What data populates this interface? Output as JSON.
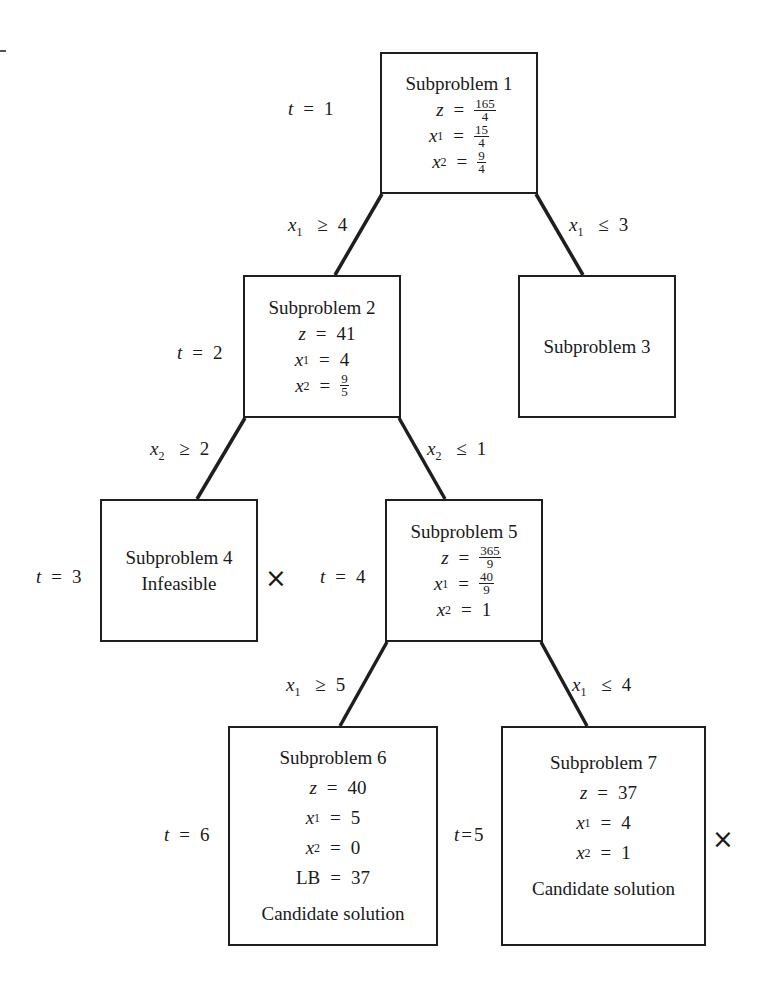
{
  "diagram": {
    "type": "branch-and-bound-tree",
    "iteration_prefix": "t",
    "nodes": [
      {
        "id": 1,
        "title": "Subproblem 1",
        "iteration": "1",
        "z": {
          "num": "165",
          "den": "4"
        },
        "x1": {
          "num": "15",
          "den": "4"
        },
        "x2": {
          "num": "9",
          "den": "4"
        }
      },
      {
        "id": 2,
        "title": "Subproblem 2",
        "iteration": "2",
        "z": "41",
        "x1": "4",
        "x2": {
          "num": "9",
          "den": "5"
        }
      },
      {
        "id": 3,
        "title": "Subproblem 3"
      },
      {
        "id": 4,
        "title": "Subproblem 4",
        "iteration": "3",
        "status": "Infeasible",
        "fathomed": true
      },
      {
        "id": 5,
        "title": "Subproblem 5",
        "iteration": "4",
        "z": {
          "num": "365",
          "den": "9"
        },
        "x1": {
          "num": "40",
          "den": "9"
        },
        "x2": "1"
      },
      {
        "id": 6,
        "title": "Subproblem 6",
        "iteration": "6",
        "z": "40",
        "x1": "5",
        "x2": "0",
        "LB": "37",
        "status": "Candidate solution"
      },
      {
        "id": 7,
        "title": "Subproblem 7",
        "iteration": "5",
        "z": "37",
        "x1": "4",
        "x2": "1",
        "status": "Candidate solution",
        "fathomed": true
      }
    ],
    "edges": [
      {
        "from": 1,
        "to": 2,
        "var": "x",
        "sub": "1",
        "op": "≥",
        "val": "4"
      },
      {
        "from": 1,
        "to": 3,
        "var": "x",
        "sub": "1",
        "op": "≤",
        "val": "3"
      },
      {
        "from": 2,
        "to": 4,
        "var": "x",
        "sub": "2",
        "op": "≥",
        "val": "2"
      },
      {
        "from": 2,
        "to": 5,
        "var": "x",
        "sub": "2",
        "op": "≤",
        "val": "1"
      },
      {
        "from": 5,
        "to": 6,
        "var": "x",
        "sub": "1",
        "op": "≥",
        "val": "5"
      },
      {
        "from": 5,
        "to": 7,
        "var": "x",
        "sub": "1",
        "op": "≤",
        "val": "4"
      }
    ],
    "symbols": {
      "z": "z",
      "x": "x",
      "eq": "=",
      "lb": "LB",
      "fathom_mark": "×",
      "sub1": "1",
      "sub2": "2"
    },
    "colors": {
      "line": "#1e1e1e",
      "background": "#ffffff",
      "text": "#1a1a1a"
    }
  }
}
